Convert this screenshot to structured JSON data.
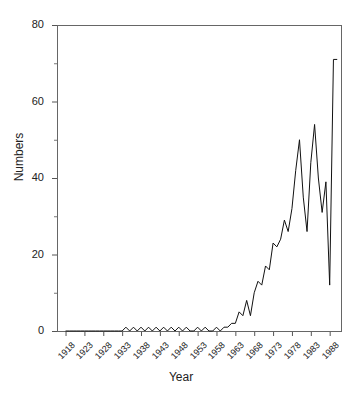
{
  "chart_data": {
    "type": "line",
    "title": "",
    "xlabel": "Year",
    "ylabel": "Numbers",
    "xlim": [
      1916,
      1991
    ],
    "ylim": [
      0,
      80
    ],
    "grid": false,
    "legend": null,
    "y_ticks": [
      0,
      20,
      40,
      60,
      80
    ],
    "y_ticks_minor": [
      10,
      30,
      50,
      70
    ],
    "x_ticks": [
      1918,
      1923,
      1928,
      1933,
      1938,
      1943,
      1948,
      1953,
      1958,
      1963,
      1968,
      1973,
      1978,
      1983,
      1988
    ],
    "x_tick_labels": [
      "1918",
      "1923",
      "1928",
      "1933",
      "1938",
      "1943",
      "1948",
      "1953",
      "1958",
      "1963",
      "1968",
      "1973",
      "1978",
      "1983",
      "1988"
    ],
    "series": [
      {
        "name": "Numbers",
        "color": "#111111",
        "x": [
          1918,
          1919,
          1920,
          1921,
          1922,
          1923,
          1924,
          1925,
          1926,
          1927,
          1928,
          1929,
          1930,
          1931,
          1932,
          1933,
          1934,
          1935,
          1936,
          1937,
          1938,
          1939,
          1940,
          1941,
          1942,
          1943,
          1944,
          1945,
          1946,
          1947,
          1948,
          1949,
          1950,
          1951,
          1952,
          1953,
          1954,
          1955,
          1956,
          1957,
          1958,
          1959,
          1960,
          1961,
          1962,
          1963,
          1964,
          1965,
          1966,
          1967,
          1968,
          1969,
          1970,
          1971,
          1972,
          1973,
          1974,
          1975,
          1976,
          1977,
          1978,
          1979,
          1980,
          1981,
          1982,
          1983,
          1984,
          1985,
          1986,
          1987,
          1988,
          1989,
          1990
        ],
        "y": [
          0,
          0,
          0,
          0,
          0,
          0,
          0,
          0,
          0,
          0,
          0,
          0,
          0,
          0,
          0,
          0,
          1,
          0,
          1,
          0,
          1,
          0,
          1,
          0,
          1,
          0,
          1,
          0,
          1,
          0,
          1,
          0,
          1,
          0,
          0,
          1,
          0,
          1,
          0,
          0,
          1,
          0,
          1,
          1,
          2,
          2,
          5,
          4,
          8,
          4,
          10,
          13,
          12,
          17,
          16,
          23,
          22,
          24,
          29,
          26,
          32,
          42,
          50,
          35,
          26,
          44,
          54,
          40,
          31,
          39,
          12,
          71,
          71
        ]
      }
    ]
  },
  "axis": {
    "x_title": "Year",
    "y_title": "Numbers"
  }
}
